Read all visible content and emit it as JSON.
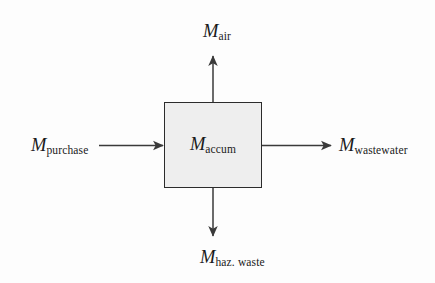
{
  "figure": {
    "type": "mass-balance-control-volume-diagram",
    "background_color": "#fdfdfd",
    "box": {
      "fill_color": "#eeeeee",
      "border_color": "#2b2b2b",
      "variable": "M",
      "subscript": "accum"
    },
    "arrow_color": "#3a3a3a",
    "flows": [
      {
        "id": "air",
        "direction": "up",
        "kind": "outflow",
        "variable": "M",
        "subscript": "air"
      },
      {
        "id": "purchase",
        "direction": "right",
        "kind": "inflow",
        "variable": "M",
        "subscript": "purchase"
      },
      {
        "id": "wastewater",
        "direction": "right",
        "kind": "outflow",
        "variable": "M",
        "subscript": "wastewater"
      },
      {
        "id": "haz-waste",
        "direction": "down",
        "kind": "outflow",
        "variable": "M",
        "subscript": "haz. waste"
      }
    ],
    "bleed_through_text": {
      "line_1": "     ",
      "line_2": "    ",
      "line_3": "   "
    }
  }
}
